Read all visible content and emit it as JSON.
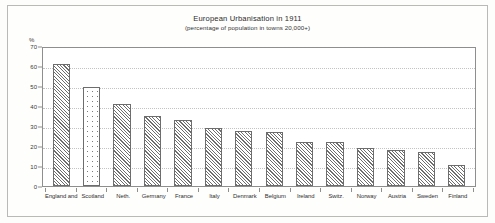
{
  "chart_data": {
    "type": "bar",
    "title": "European Urbanisation in 1911",
    "subtitle": "(percentage of population in towns 20,000+)",
    "xlabel": "",
    "ylabel": "%",
    "ylim": [
      0,
      70
    ],
    "yticks": [
      0,
      10,
      20,
      30,
      40,
      50,
      60,
      70
    ],
    "grid": true,
    "legend": "none",
    "categories": [
      "England and",
      "Scotland",
      "Neth.",
      "Germany",
      "France",
      "Italy",
      "Denmark",
      "Belgium",
      "Ireland",
      "Switz.",
      "Norway",
      "Austria",
      "Sweden",
      "Finland"
    ],
    "values": [
      61,
      49.5,
      41,
      35,
      33,
      29,
      27.5,
      27,
      22,
      22,
      19,
      18,
      17,
      10.5
    ],
    "bar_patterns": [
      "hatch",
      "dots",
      "hatch",
      "hatch",
      "hatch",
      "hatch",
      "hatch",
      "hatch",
      "hatch",
      "hatch",
      "hatch",
      "hatch",
      "hatch",
      "hatch"
    ]
  },
  "colors": {
    "page_background": "#fdfdfc",
    "figure_border": "#b9b9b6",
    "axis": "#8e8e8e",
    "gridline": "#c3c3c3",
    "bar_outline": "#6d6d6d",
    "bar_fill": "#6e6e6e",
    "text": "#2b2b2b"
  }
}
